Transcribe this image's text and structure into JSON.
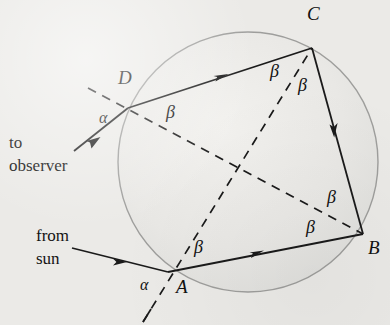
{
  "figure": {
    "background_color": "#ebeae7",
    "ink_color": "#1a1a1a",
    "drop_fill": "#e7e6e3",
    "drop_stroke": "#9a9a98"
  },
  "droplet": {
    "cx": 248,
    "cy": 162,
    "r": 130,
    "label": "raindrop"
  },
  "vertices": [
    {
      "id": "A",
      "label": "A",
      "x": 168,
      "y": 272,
      "label_x": 176,
      "label_y": 277
    },
    {
      "id": "B",
      "label": "B",
      "x": 363,
      "y": 234,
      "label_x": 368,
      "label_y": 238
    },
    {
      "id": "C",
      "label": "C",
      "x": 312,
      "y": 48,
      "label_x": 307,
      "label_y": 6
    },
    {
      "id": "D",
      "label": "D",
      "x": 128,
      "y": 108,
      "label_x": 118,
      "label_y": 70
    }
  ],
  "rays": [
    {
      "name": "incident-ray-from-sun",
      "from": [
        72,
        248
      ],
      "to": [
        168,
        272
      ],
      "style": "solid",
      "arrow": "mid-forward"
    },
    {
      "name": "chord-A-to-B",
      "from": [
        168,
        272
      ],
      "to": [
        363,
        234
      ],
      "style": "solid",
      "arrow": "mid-forward"
    },
    {
      "name": "chord-B-to-C",
      "from": [
        363,
        234
      ],
      "to": [
        312,
        48
      ],
      "style": "solid",
      "arrow": "mid-forward"
    },
    {
      "name": "chord-C-to-D",
      "from": [
        312,
        48
      ],
      "to": [
        128,
        108
      ],
      "style": "solid",
      "arrow": "mid-forward"
    },
    {
      "name": "exit-ray-to-observer",
      "from": [
        128,
        108
      ],
      "to": [
        73,
        152
      ],
      "style": "solid",
      "arrow": "end-forward"
    }
  ],
  "normals": [
    {
      "name": "normal-at-A",
      "from": [
        143,
        322
      ],
      "to": [
        312,
        48
      ],
      "style": "dashed"
    },
    {
      "name": "normal-at-D",
      "from": [
        88,
        88
      ],
      "to": [
        363,
        234
      ],
      "style": "dashed"
    }
  ],
  "angle_labels": [
    {
      "id": "alpha-at-D",
      "text": "α",
      "x": 99,
      "y": 110,
      "kind": "alpha"
    },
    {
      "id": "alpha-at-A",
      "text": "α",
      "x": 140,
      "y": 277,
      "kind": "alpha"
    },
    {
      "id": "beta-at-D",
      "text": "β",
      "x": 166,
      "y": 103,
      "kind": "beta"
    },
    {
      "id": "beta-at-C-left",
      "text": "β",
      "x": 270,
      "y": 62,
      "kind": "beta"
    },
    {
      "id": "beta-at-C-right",
      "text": "β",
      "x": 298,
      "y": 76,
      "kind": "beta"
    },
    {
      "id": "beta-at-B-upper",
      "text": "β",
      "x": 327,
      "y": 188,
      "kind": "beta"
    },
    {
      "id": "beta-at-B-lower",
      "text": "β",
      "x": 306,
      "y": 218,
      "kind": "beta"
    },
    {
      "id": "beta-at-A",
      "text": "β",
      "x": 194,
      "y": 238,
      "kind": "beta"
    }
  ],
  "captions": [
    {
      "id": "to-observer",
      "lines": [
        "to",
        "observer"
      ],
      "x": 9,
      "y": 134
    },
    {
      "id": "from-sun",
      "lines": [
        "from",
        "sun"
      ],
      "x": 36,
      "y": 227
    }
  ],
  "legend": {
    "alpha_symbol": "α",
    "beta_symbol": "β"
  }
}
